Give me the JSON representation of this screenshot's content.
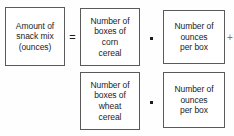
{
  "diagram": {
    "type": "equation-boxes",
    "boxes": {
      "amount": {
        "label": "Amount of\nsnack mix\n(ounces)",
        "lines": [
          "Amount of",
          "snack mix",
          "(ounces)"
        ]
      },
      "corn_boxes": {
        "label": "Number of\nboxes of\ncorn\ncereal",
        "lines": [
          "Number of",
          "boxes of",
          "corn",
          "cereal"
        ]
      },
      "corn_ounces": {
        "label": "Number of\nounces\nper box",
        "lines": [
          "Number of",
          "ounces",
          "per box"
        ]
      },
      "wheat_boxes": {
        "label": "Number of\nboxes of\nwheat\ncereal",
        "lines": [
          "Number of",
          "boxes of",
          "wheat",
          "cereal"
        ]
      },
      "wheat_ounces": {
        "label": "Number of\nounces\nper box",
        "lines": [
          "Number of",
          "ounces",
          "per box"
        ]
      }
    },
    "operators": {
      "equals": "=",
      "times_top": "·",
      "times_bottom": "·",
      "plus_clipped": "+"
    },
    "colors": {
      "box_border": "#5a5a5a",
      "box_fill": "#ffffff",
      "text": "#1c1c1c",
      "background": "#fefefe",
      "clipped_operator": "#777777"
    }
  }
}
